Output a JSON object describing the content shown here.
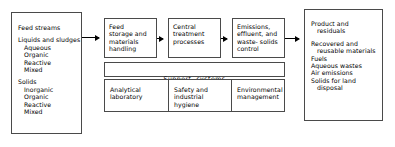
{
  "diagram": {
    "background": "#ffffff",
    "line_color": "#4a4a4a",
    "arrow_color": "#000000"
  },
  "feed_box": {
    "name": "Feed streams",
    "groups": [
      {
        "heading": "Liquids and sludges",
        "items": [
          "Aqueous",
          "Organic",
          "Reactive",
          "Mixed"
        ]
      },
      {
        "heading": "Solids",
        "items": [
          "Inorganic",
          "Organic",
          "Reactive",
          "Mixed"
        ]
      }
    ]
  },
  "process_boxes": [
    {
      "id": "feed-storage",
      "label": "Feed\nstorage and\nmaterials\nhandling"
    },
    {
      "id": "central-treatment",
      "label": "Central\ntreatment\nprocesses"
    },
    {
      "id": "emissions-control",
      "label": "Emissions,\neffluent, and\nwaste- solids\ncontrol"
    }
  ],
  "support_systems": {
    "band_label": "Support  systems",
    "cells": [
      {
        "id": "analytical-laboratory",
        "label": "Analytical\nlaboratory"
      },
      {
        "id": "safety-industrial-hygiene",
        "label": "Safety and\nindustrial\nhygiene"
      },
      {
        "id": "environmental-management",
        "label": "Environmental\nmanagement"
      }
    ]
  },
  "product_box": {
    "name": "Product and\n   residuals",
    "items": [
      "Recovered and\n   reusable materials",
      "Fuels",
      "Aqueous wastes",
      "Air emissions",
      "Solids for land\n   disposal"
    ]
  },
  "arrows": [
    {
      "id": "feed-to-storage",
      "from": "feed_box",
      "to": "feed-storage"
    },
    {
      "id": "storage-to-central",
      "from": "feed-storage",
      "to": "central-treatment"
    },
    {
      "id": "central-to-emissions",
      "from": "central-treatment",
      "to": "emissions-control"
    },
    {
      "id": "emissions-to-product",
      "from": "emissions-control",
      "to": "product_box"
    }
  ]
}
